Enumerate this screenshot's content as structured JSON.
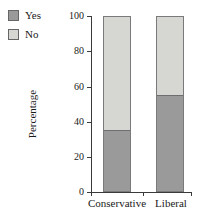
{
  "chart_data": {
    "type": "bar",
    "subtype": "stacked-percentage",
    "title": "",
    "xlabel": "",
    "ylabel": "Percentage",
    "ylim": [
      0,
      100
    ],
    "yticks": [
      0,
      20,
      40,
      60,
      80,
      100
    ],
    "categories": [
      "Conservative",
      "Liberal"
    ],
    "series": [
      {
        "name": "Yes",
        "color": "#9a9a9a",
        "values": [
          35,
          55
        ]
      },
      {
        "name": "No",
        "color": "#d6d6d2",
        "values": [
          65,
          45
        ]
      }
    ],
    "grid": false,
    "legend_position": "top-left"
  },
  "legend": {
    "items": [
      {
        "label": "Yes",
        "swatch_name": "legend-swatch-yes"
      },
      {
        "label": "No",
        "swatch_name": "legend-swatch-no"
      }
    ]
  },
  "axes": {
    "y_title": "Percentage",
    "y_tick_labels": [
      "100",
      "80",
      "60",
      "40",
      "20",
      "0"
    ],
    "x_tick_labels": [
      "Conservative",
      "Liberal"
    ]
  },
  "colors": {
    "yes": "#9a9a9a",
    "no": "#d6d6d2",
    "axis": "#3a3a3a",
    "bar_border": "#7a7a7a",
    "background": "#ffffff"
  }
}
